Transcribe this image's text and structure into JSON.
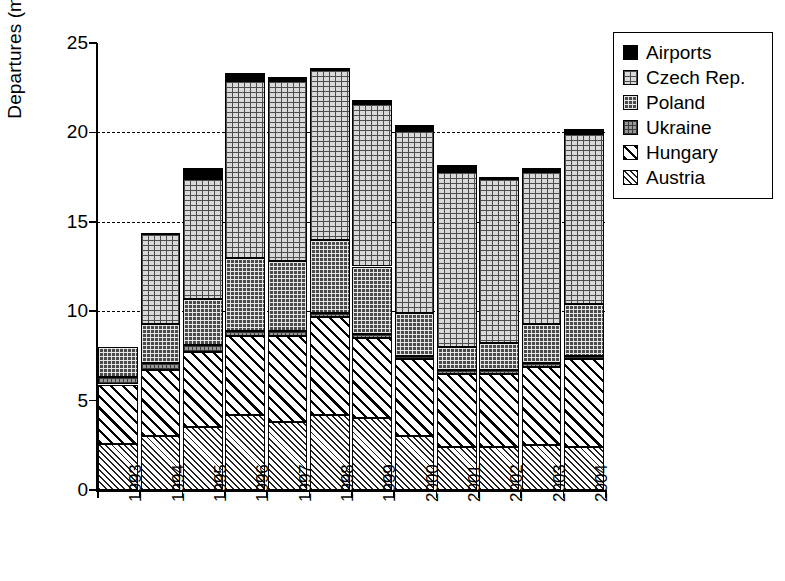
{
  "chart_data": {
    "type": "bar",
    "stacked": true,
    "title": "",
    "xlabel": "",
    "ylabel": "Departures (millions)",
    "ylim": [
      0,
      25
    ],
    "yticks": [
      0,
      5,
      10,
      15,
      20,
      25
    ],
    "gridlines": [
      10,
      15,
      20
    ],
    "grid": "dashed horizontal gridlines at 10, 15 and 20",
    "legend_position": "right",
    "categories": [
      "1993",
      "1994",
      "1995",
      "1996",
      "1997",
      "1998",
      "1999",
      "2000",
      "2001",
      "2002",
      "2003",
      "2004"
    ],
    "series": [
      {
        "name": "Austria",
        "pattern": "diagonal-fine-hatch",
        "values": [
          2.6,
          3.0,
          3.5,
          4.2,
          3.8,
          4.2,
          4.0,
          3.0,
          2.4,
          2.4,
          2.5,
          2.4
        ]
      },
      {
        "name": "Hungary",
        "pattern": "diagonal-slash",
        "values": [
          3.3,
          3.7,
          4.2,
          4.4,
          4.8,
          5.5,
          4.5,
          4.3,
          4.1,
          4.1,
          4.4,
          4.9
        ]
      },
      {
        "name": "Ukraine",
        "pattern": "gray-grid",
        "values": [
          0.4,
          0.4,
          0.4,
          0.3,
          0.3,
          0.2,
          0.2,
          0.2,
          0.2,
          0.2,
          0.2,
          0.2
        ]
      },
      {
        "name": "Poland",
        "pattern": "dark-dotted-grid",
        "values": [
          1.7,
          2.2,
          2.6,
          4.1,
          3.9,
          4.1,
          3.8,
          2.4,
          1.3,
          1.5,
          2.2,
          2.9
        ]
      },
      {
        "name": "Czech Rep.",
        "pattern": "light-grid",
        "values": [
          0.0,
          5.0,
          6.7,
          9.9,
          10.1,
          9.5,
          9.1,
          10.2,
          9.8,
          9.2,
          8.5,
          9.5
        ]
      },
      {
        "name": "Airports",
        "pattern": "solid-black",
        "values": [
          0.0,
          0.1,
          0.6,
          0.4,
          0.2,
          0.1,
          0.2,
          0.3,
          0.4,
          0.1,
          0.2,
          0.3
        ]
      }
    ],
    "totals": [
      8.0,
      14.4,
      18.0,
      23.3,
      23.1,
      23.6,
      21.8,
      20.4,
      18.2,
      17.5,
      18.0,
      20.2
    ]
  },
  "axis": {
    "y_label": "Departures (millions)",
    "y_ticks": [
      "25",
      "20",
      "15",
      "10",
      "5",
      "0"
    ],
    "x_ticks": [
      "1993",
      "1994",
      "1995",
      "1996",
      "1997",
      "1998",
      "1999",
      "2000",
      "2001",
      "2002",
      "2003",
      "2004"
    ]
  },
  "legend": {
    "items": [
      {
        "label": "Airports",
        "pattern": "solid-black"
      },
      {
        "label": "Czech Rep.",
        "pattern": "light-grid"
      },
      {
        "label": "Poland",
        "pattern": "dark-dotted-grid"
      },
      {
        "label": "Ukraine",
        "pattern": "gray-grid"
      },
      {
        "label": "Hungary",
        "pattern": "diagonal-slash"
      },
      {
        "label": "Austria",
        "pattern": "diagonal-fine-hatch"
      }
    ]
  },
  "colors": {
    "axis": "#000000",
    "background": "#ffffff"
  }
}
